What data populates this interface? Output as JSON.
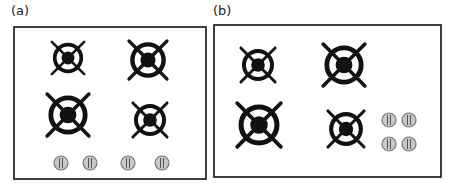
{
  "panels": [
    {
      "label": "(a)",
      "box": {
        "x": 14,
        "y": 27,
        "w": 192,
        "h": 152
      },
      "burners": [
        {
          "cx": 68,
          "cy": 58,
          "r": 17
        },
        {
          "cx": 148,
          "cy": 60,
          "r": 20
        },
        {
          "cx": 68,
          "cy": 115,
          "r": 22
        },
        {
          "cx": 150,
          "cy": 120,
          "r": 18
        }
      ],
      "knobs": [
        {
          "cx": 61,
          "cy": 163
        },
        {
          "cx": 90,
          "cy": 163
        },
        {
          "cx": 128,
          "cy": 163
        },
        {
          "cx": 162,
          "cy": 163
        }
      ]
    },
    {
      "label": "(b)",
      "box": {
        "x": 214,
        "y": 25,
        "w": 227,
        "h": 152
      },
      "burners": [
        {
          "cx": 258,
          "cy": 65,
          "r": 18
        },
        {
          "cx": 344,
          "cy": 65,
          "r": 22
        },
        {
          "cx": 259,
          "cy": 125,
          "r": 23
        },
        {
          "cx": 346,
          "cy": 129,
          "r": 19
        }
      ],
      "knobs": [
        {
          "cx": 389,
          "cy": 120
        },
        {
          "cx": 409,
          "cy": 120
        },
        {
          "cx": 389,
          "cy": 144
        },
        {
          "cx": 409,
          "cy": 144
        }
      ]
    }
  ],
  "colors": {
    "stroke": "#111111",
    "knob_fill": "#c8c8c8",
    "knob_stroke": "#777777"
  }
}
